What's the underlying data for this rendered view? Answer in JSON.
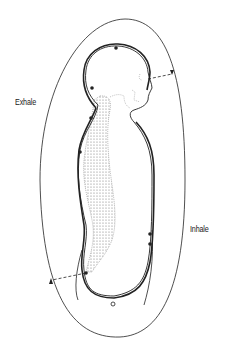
{
  "diagram": {
    "labels": {
      "exhale": "Exhale",
      "inhale": "Inhale"
    },
    "colors": {
      "line": "#222222",
      "background": "#ffffff",
      "spine": "#666666"
    },
    "elements": [
      "outer-breath-loop",
      "body-outline",
      "energy-channel-line",
      "spine-vertebrae",
      "exhale-arrow-dashed",
      "inhale-arrow-dashed",
      "channel-nodes"
    ]
  }
}
